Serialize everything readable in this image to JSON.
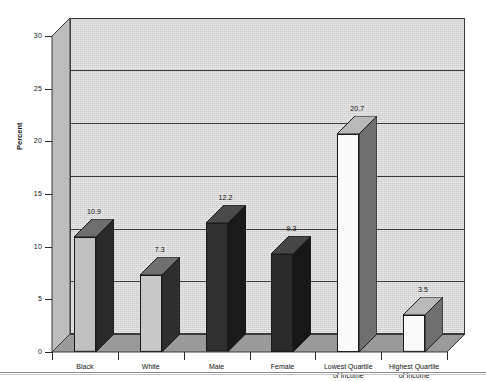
{
  "chart_data": {
    "type": "bar",
    "title": "",
    "xlabel": "",
    "ylabel": "Percent",
    "ylim": [
      0,
      30
    ],
    "yticks": [
      0,
      5,
      10,
      15,
      20,
      25,
      30
    ],
    "ytick_labels": [
      "0",
      "5",
      "10",
      "15",
      "20",
      "25",
      "30"
    ],
    "grid": true,
    "legend": "none",
    "three_d": true,
    "categories": [
      "Black",
      "White",
      "Male",
      "Female",
      "Lowest Quartile of Income",
      "Highest Quartile of Income"
    ],
    "category_lines": [
      [
        "Black"
      ],
      [
        "White"
      ],
      [
        "Male"
      ],
      [
        "Female"
      ],
      [
        "Lowest Quartile",
        "of Income"
      ],
      [
        "Highest Quartile",
        "of Income"
      ]
    ],
    "values": [
      10.9,
      7.3,
      12.2,
      9.3,
      20.7,
      3.5
    ],
    "value_labels": [
      "10.9",
      "7.3",
      "12.2",
      "9.3",
      "20.7",
      "3.5"
    ],
    "bar_styles": [
      {
        "front": "#c0c0c0",
        "side": "#2a2a2a",
        "top": "#6e6e6e"
      },
      {
        "front": "#c8c8c8",
        "side": "#2e2e2e",
        "top": "#707070"
      },
      {
        "front": "#2f2f2f",
        "side": "#1a1a1a",
        "top": "#4a4a4a"
      },
      {
        "front": "#2b2b2b",
        "side": "#171717",
        "top": "#474747"
      },
      {
        "front": "#fbfbfb",
        "side": "#6f6f6f",
        "top": "#b9b9b9"
      },
      {
        "front": "#fbfbfb",
        "side": "#6f6f6f",
        "top": "#b9b9b9"
      }
    ],
    "colors": {
      "back_wall": "#cdcdcd",
      "floor": "#9a9a9a",
      "side_wall": "#bcbcbc",
      "gridline": "#3a3a3a",
      "text": "#111111"
    }
  }
}
